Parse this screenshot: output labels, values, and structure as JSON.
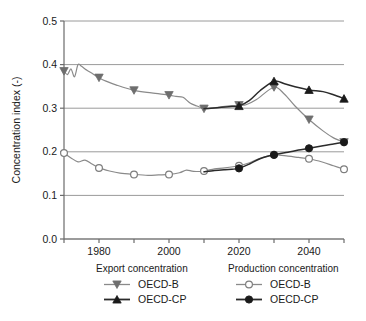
{
  "chart_data": {
    "type": "line",
    "title": "",
    "xlabel": "",
    "ylabel": "Concentration index (-)",
    "xlim": [
      1970,
      2050
    ],
    "ylim": [
      0.0,
      0.5
    ],
    "grid": true,
    "grid_axis": "y",
    "xticks": [
      1980,
      2000,
      2020,
      2040
    ],
    "xtick_labels": [
      "1980",
      "2000",
      "2020",
      "2040"
    ],
    "xticks_minor": [
      1970,
      1990,
      2010,
      2030,
      2050
    ],
    "yticks": [
      0.0,
      0.1,
      0.2,
      0.3,
      0.4,
      0.5
    ],
    "ytick_labels": [
      "0.0",
      "0.1",
      "0.2",
      "0.3",
      "0.4",
      "0.5"
    ],
    "legend_position": "below-plot",
    "series": [
      {
        "name": "OECD-B",
        "group": "Export concentration",
        "marker": "triangle-down",
        "marker_color": "#6e6e6e",
        "line_color": "#8a8a8a",
        "marker_years": [
          1970,
          1980,
          1990,
          2000,
          2010,
          2020,
          2030,
          2040,
          2050
        ],
        "marker_values": [
          0.385,
          0.37,
          0.341,
          0.33,
          0.299,
          0.307,
          0.348,
          0.274,
          0.222
        ],
        "x": [
          1970,
          1971,
          1972,
          1973,
          1974,
          1975,
          1976,
          1977,
          1978,
          1980,
          1982,
          1985,
          1990,
          1995,
          2000,
          2002,
          2004,
          2006,
          2008,
          2010,
          2012,
          2015,
          2018,
          2020,
          2022,
          2025,
          2030,
          2033,
          2036,
          2040,
          2044,
          2047,
          2050
        ],
        "y": [
          0.385,
          0.377,
          0.39,
          0.372,
          0.4,
          0.396,
          0.39,
          0.385,
          0.38,
          0.37,
          0.362,
          0.353,
          0.341,
          0.335,
          0.33,
          0.327,
          0.325,
          0.312,
          0.305,
          0.299,
          0.3,
          0.303,
          0.306,
          0.307,
          0.308,
          0.32,
          0.348,
          0.332,
          0.305,
          0.274,
          0.248,
          0.232,
          0.222
        ]
      },
      {
        "name": "OECD-CP",
        "group": "Export concentration",
        "marker": "triangle-up",
        "marker_color": "#1a1a1a",
        "line_color": "#2b2b2b",
        "marker_years": [
          2020,
          2030,
          2040,
          2050
        ],
        "marker_values": [
          0.305,
          0.362,
          0.342,
          0.322
        ],
        "x": [
          2010,
          2012,
          2015,
          2018,
          2020,
          2023,
          2026,
          2030,
          2033,
          2036,
          2040,
          2044,
          2047,
          2050
        ],
        "y": [
          0.299,
          0.3,
          0.302,
          0.304,
          0.305,
          0.318,
          0.34,
          0.362,
          0.356,
          0.349,
          0.342,
          0.338,
          0.331,
          0.322
        ]
      },
      {
        "name": "OECD-B",
        "group": "Production concentration",
        "marker": "circle-open",
        "marker_color": "#ffffff",
        "line_color": "#8a8a8a",
        "marker_years": [
          1970,
          1980,
          1990,
          2000,
          2010,
          2020,
          2030,
          2040,
          2050
        ],
        "marker_values": [
          0.197,
          0.163,
          0.148,
          0.148,
          0.156,
          0.168,
          0.193,
          0.184,
          0.16
        ],
        "x": [
          1970,
          1972,
          1974,
          1976,
          1978,
          1980,
          1983,
          1986,
          1990,
          1994,
          1997,
          2000,
          2003,
          2005,
          2007,
          2010,
          2013,
          2016,
          2020,
          2023,
          2026,
          2030,
          2034,
          2037,
          2040,
          2044,
          2047,
          2050
        ],
        "y": [
          0.197,
          0.186,
          0.177,
          0.181,
          0.172,
          0.163,
          0.156,
          0.151,
          0.148,
          0.146,
          0.147,
          0.148,
          0.152,
          0.158,
          0.155,
          0.156,
          0.161,
          0.163,
          0.168,
          0.175,
          0.185,
          0.193,
          0.19,
          0.187,
          0.184,
          0.176,
          0.168,
          0.16
        ]
      },
      {
        "name": "OECD-CP",
        "group": "Production concentration",
        "marker": "circle-filled",
        "marker_color": "#1a1a1a",
        "line_color": "#2b2b2b",
        "marker_years": [
          2020,
          2030,
          2040,
          2050
        ],
        "marker_values": [
          0.162,
          0.193,
          0.208,
          0.222
        ],
        "x": [
          2010,
          2013,
          2016,
          2018,
          2020,
          2023,
          2026,
          2030,
          2034,
          2037,
          2040,
          2044,
          2047,
          2050
        ],
        "y": [
          0.154,
          0.157,
          0.159,
          0.16,
          0.162,
          0.172,
          0.184,
          0.193,
          0.199,
          0.204,
          0.208,
          0.214,
          0.218,
          0.222
        ]
      }
    ]
  },
  "axes": {
    "ylabel": "Concentration index (-)",
    "ytick_labels": [
      "0.5",
      "0.4",
      "0.3",
      "0.2",
      "0.1",
      "0.0"
    ],
    "xtick_labels": [
      "1980",
      "2000",
      "2020",
      "2040"
    ]
  },
  "legend": {
    "groups": [
      {
        "heading": "Export concentration",
        "entries": [
          {
            "label": "OECD-B",
            "marker": "triangle-down",
            "marker_color": "#6e6e6e",
            "line_color": "#8a8a8a"
          },
          {
            "label": "OECD-CP",
            "marker": "triangle-up",
            "marker_color": "#1a1a1a",
            "line_color": "#2b2b2b"
          }
        ]
      },
      {
        "heading": "Production concentration",
        "entries": [
          {
            "label": "OECD-B",
            "marker": "circle-open",
            "marker_color": "#ffffff",
            "line_color": "#8a8a8a"
          },
          {
            "label": "OECD-CP",
            "marker": "circle-filled",
            "marker_color": "#1a1a1a",
            "line_color": "#2b2b2b"
          }
        ]
      }
    ]
  },
  "colors": {
    "axis": "#6b6b6b",
    "grid": "#9a9a9a",
    "gray_series": "#8a8a8a",
    "black_series": "#2b2b2b",
    "background": "#ffffff"
  }
}
